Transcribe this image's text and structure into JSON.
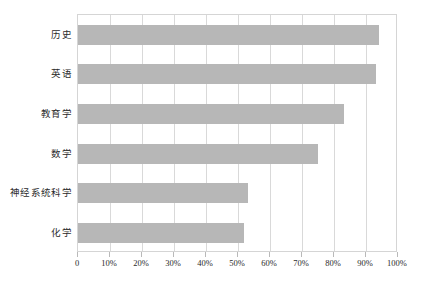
{
  "chart_data": {
    "type": "bar",
    "orientation": "horizontal",
    "title": "",
    "xlabel": "",
    "ylabel": "",
    "categories": [
      "历史",
      "英语",
      "教育学",
      "数学",
      "神经系统科学",
      "化学"
    ],
    "values": [
      94,
      93,
      83,
      75,
      53,
      52
    ],
    "value_suffix": "%",
    "xlim": [
      0,
      100
    ],
    "xticks": [
      0,
      10,
      20,
      30,
      40,
      50,
      60,
      70,
      80,
      90,
      100
    ],
    "xticklabels": [
      "0",
      "10%",
      "20%",
      "30%",
      "40%",
      "50%",
      "60%",
      "70%",
      "80%",
      "90%",
      "100%"
    ],
    "grid": "vertical",
    "legend": "none",
    "series": [
      {
        "name": "",
        "values": [
          94,
          93,
          83,
          75,
          53,
          52
        ]
      }
    ],
    "colors": {
      "bar_fill": "#b7b7b7",
      "gridline": "#d9d9d9",
      "frame": "#d5d5d5",
      "text": "#2b2b2b",
      "background": "#ffffff"
    }
  }
}
